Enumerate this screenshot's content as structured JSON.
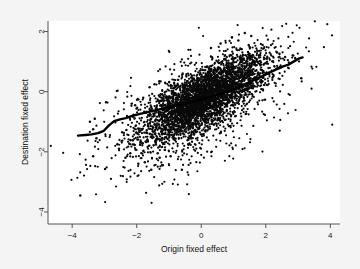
{
  "chart_data": {
    "type": "scatter",
    "title": "",
    "xlabel": "Origin fixed effect",
    "ylabel": "Destination fixed effect",
    "xlim": [
      -4.75,
      4.3
    ],
    "ylim": [
      -4.4,
      2.35
    ],
    "xticks": [
      -4,
      -2,
      0,
      2,
      4
    ],
    "xticklabels": [
      "-4",
      "-2",
      "0",
      "2",
      "4"
    ],
    "yticks": [
      2,
      0,
      -2,
      -4
    ],
    "yticklabels": [
      "2",
      "0",
      "-2",
      "-4"
    ],
    "grid": false,
    "legend": null,
    "n_points": 4200,
    "point_marker": "filled-circle",
    "point_size": 1.1,
    "point_color": "#0a0a0a",
    "background_color": "#ffffff",
    "figure_background_color": "#f4f4f4",
    "series": [
      {
        "name": "Fixed effect pairs",
        "type": "scatter",
        "description": "Dense positively-correlated elliptical cloud centred near (0.1, -0.15) with correlation about 0.72, long axis oriented along the 45 degree direction, plus a sparse diffuse halo of outliers extending to the lower left.",
        "cloud": {
          "center_x": 0.15,
          "center_y": -0.15,
          "sd_x": 0.95,
          "sd_y": 0.72,
          "correlation": 0.74,
          "n_core": 3400
        },
        "halo": {
          "center_x": -0.35,
          "center_y": -0.75,
          "sd_x": 1.45,
          "sd_y": 1.15,
          "correlation": 0.55,
          "n_halo": 760
        },
        "outliers": [
          [
            -3.75,
            -3.45
          ],
          [
            -3.35,
            -2.15
          ],
          [
            -3.3,
            -0.9
          ],
          [
            -3.45,
            -1.0
          ],
          [
            -3.35,
            -1.25
          ],
          [
            -2.95,
            -0.35
          ],
          [
            -3.25,
            -1.55
          ],
          [
            -2.6,
            -1.75
          ],
          [
            -2.55,
            -1.9
          ],
          [
            -2.35,
            -2.2
          ],
          [
            -2.2,
            -2.05
          ],
          [
            -2.45,
            -1.35
          ],
          [
            -1.95,
            -2.4
          ],
          [
            -1.75,
            -2.35
          ],
          [
            -1.55,
            -2.6
          ],
          [
            -1.35,
            -2.05
          ],
          [
            -1.2,
            -2.45
          ],
          [
            -0.95,
            -2.15
          ],
          [
            -0.6,
            -2.6
          ],
          [
            -2.05,
            -0.45
          ],
          [
            -1.8,
            -0.2
          ],
          [
            -1.6,
            0.15
          ],
          [
            -1.45,
            0.25
          ],
          [
            -1.3,
            0.35
          ],
          [
            3.1,
            0.45
          ],
          [
            2.85,
            1.2
          ],
          [
            2.6,
            1.15
          ],
          [
            2.35,
            1.3
          ],
          [
            1.9,
            1.55
          ],
          [
            1.55,
            1.85
          ],
          [
            1.35,
            1.95
          ],
          [
            1.15,
            1.7
          ],
          [
            0.95,
            1.8
          ],
          [
            0.6,
            1.6
          ],
          [
            0.3,
            1.45
          ]
        ]
      },
      {
        "name": "Lowess smoother",
        "type": "line",
        "color": "#000000",
        "linewidth": 2.4,
        "points": [
          [
            -3.82,
            -1.46
          ],
          [
            -3.6,
            -1.44
          ],
          [
            -3.4,
            -1.42
          ],
          [
            -3.2,
            -1.38
          ],
          [
            -3.02,
            -1.3
          ],
          [
            -2.86,
            -1.12
          ],
          [
            -2.7,
            -0.98
          ],
          [
            -2.52,
            -0.92
          ],
          [
            -2.34,
            -0.88
          ],
          [
            -2.12,
            -0.8
          ],
          [
            -1.9,
            -0.74
          ],
          [
            -1.66,
            -0.68
          ],
          [
            -1.42,
            -0.62
          ],
          [
            -1.18,
            -0.56
          ],
          [
            -0.94,
            -0.5
          ],
          [
            -0.7,
            -0.44
          ],
          [
            -0.46,
            -0.38
          ],
          [
            -0.22,
            -0.32
          ],
          [
            0.02,
            -0.25
          ],
          [
            0.26,
            -0.18
          ],
          [
            0.5,
            -0.1
          ],
          [
            0.74,
            -0.02
          ],
          [
            0.98,
            0.08
          ],
          [
            1.22,
            0.18
          ],
          [
            1.46,
            0.3
          ],
          [
            1.7,
            0.42
          ],
          [
            1.94,
            0.54
          ],
          [
            2.16,
            0.66
          ],
          [
            2.36,
            0.76
          ],
          [
            2.54,
            0.84
          ],
          [
            2.7,
            0.9
          ],
          [
            2.86,
            1.0
          ],
          [
            3.02,
            1.1
          ],
          [
            3.14,
            1.14
          ]
        ]
      }
    ]
  }
}
